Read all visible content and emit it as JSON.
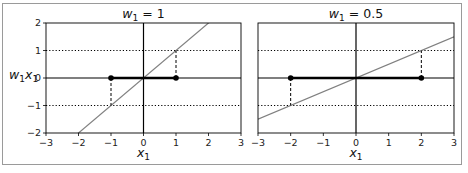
{
  "chart_data": [
    {
      "type": "line",
      "title": "w_1 = 1",
      "title_parts": {
        "var": "w",
        "sub": "1",
        "rest": " = 1"
      },
      "xlabel": "x_1",
      "ylabel": "w_1 x_1",
      "xlim": [
        -3,
        3
      ],
      "ylim": [
        -2,
        2
      ],
      "xticks": [
        -3,
        -2,
        -1,
        0,
        1,
        2,
        3
      ],
      "yticks": [
        -2,
        -1,
        0,
        1,
        2
      ],
      "xtick_labels": [
        "−3",
        "−2",
        "−1",
        "0",
        "1",
        "2",
        "3"
      ],
      "ytick_labels": [
        "−2",
        "−1",
        "0",
        "1",
        "2"
      ],
      "grid": false,
      "series": [
        {
          "name": "w1*x1 line",
          "style": "solid gray",
          "x": [
            -3,
            3
          ],
          "y": [
            -3,
            3
          ]
        },
        {
          "name": "input range",
          "style": "thick black",
          "x": [
            -1,
            1
          ],
          "y": [
            0,
            0
          ]
        },
        {
          "name": "endpoints",
          "style": "black dots",
          "x": [
            -1,
            1
          ],
          "y": [
            0,
            0
          ]
        },
        {
          "name": "projection dashes",
          "style": "dashed black",
          "segments": [
            [
              [
                -1,
                0
              ],
              [
                -1,
                -1
              ]
            ],
            [
              [
                1,
                0
              ],
              [
                1,
                1
              ]
            ]
          ]
        },
        {
          "name": "output bounds",
          "style": "dotted black",
          "y_values": [
            -1,
            1
          ]
        }
      ],
      "reference_lines": {
        "horizontal": 0,
        "vertical": 0
      }
    },
    {
      "type": "line",
      "title": "w_1 = 0.5",
      "title_parts": {
        "var": "w",
        "sub": "1",
        "rest": " = 0.5"
      },
      "xlabel": "x_1",
      "xlim": [
        -3,
        3
      ],
      "ylim": [
        -2,
        2
      ],
      "xticks": [
        -3,
        -2,
        -1,
        0,
        1,
        2,
        3
      ],
      "xtick_labels": [
        "−3",
        "−2",
        "−1",
        "0",
        "1",
        "2",
        "3"
      ],
      "grid": false,
      "series": [
        {
          "name": "w1*x1 line",
          "style": "solid gray",
          "x": [
            -3,
            3
          ],
          "y": [
            -1.5,
            1.5
          ]
        },
        {
          "name": "input range",
          "style": "thick black",
          "x": [
            -2,
            2
          ],
          "y": [
            0,
            0
          ]
        },
        {
          "name": "endpoints",
          "style": "black dots",
          "x": [
            -2,
            2
          ],
          "y": [
            0,
            0
          ]
        },
        {
          "name": "projection dashes",
          "style": "dashed black",
          "segments": [
            [
              [
                -2,
                0
              ],
              [
                -2,
                -1
              ]
            ],
            [
              [
                2,
                0
              ],
              [
                2,
                1
              ]
            ]
          ]
        },
        {
          "name": "output bounds",
          "style": "dotted black",
          "y_values": [
            -1,
            1
          ]
        }
      ],
      "reference_lines": {
        "horizontal": 0,
        "vertical": 0
      }
    }
  ],
  "colors": {
    "line": "#808080",
    "axes": "#000000",
    "frame": "#9a9a9a"
  }
}
